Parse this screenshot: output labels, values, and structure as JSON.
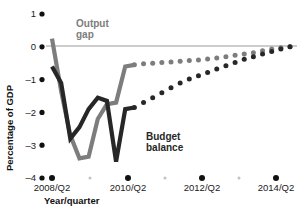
{
  "chart_data": {
    "type": "line",
    "title": "",
    "subtitle": "",
    "xlabel": "Year/quarter",
    "ylabel": "Percentage of GDP",
    "ylim": [
      -4,
      1
    ],
    "yticks": [
      1,
      0,
      -1,
      -2,
      -3,
      -4
    ],
    "ytick_labels": [
      "1",
      "0",
      "–1",
      "–2",
      "–3",
      "–4"
    ],
    "xlim": [
      "2008/Q2",
      "2014/Q4"
    ],
    "xticks": [
      "2008/Q2",
      "2010/Q2",
      "2012/Q2",
      "2014/Q2"
    ],
    "xtick_minor": [
      "2009/Q2",
      "2011/Q2",
      "2013/Q2"
    ],
    "grid": false,
    "zero_line": true,
    "legend_position": "inline-annotations",
    "annotations": [
      {
        "text": "Output gap",
        "color": "#7d7d7d",
        "series": "output_gap"
      },
      {
        "text": "Budget balance",
        "color": "#272727",
        "series": "budget_balance"
      }
    ],
    "x": [
      "2008/Q2",
      "2008/Q3",
      "2008/Q4",
      "2009/Q1",
      "2009/Q2",
      "2009/Q3",
      "2009/Q4",
      "2010/Q1",
      "2010/Q2",
      "2010/Q3",
      "2010/Q4",
      "2011/Q1",
      "2011/Q2",
      "2011/Q3",
      "2011/Q4",
      "2012/Q1",
      "2012/Q2",
      "2012/Q3",
      "2012/Q4",
      "2013/Q1",
      "2013/Q2",
      "2013/Q3",
      "2013/Q4",
      "2014/Q1",
      "2014/Q2",
      "2014/Q3",
      "2014/Q4"
    ],
    "series": [
      {
        "name": "Output gap",
        "color": "#7d7d7d",
        "style_actual": "solid",
        "style_forecast": "dotted",
        "forecast_starts_at": "2010/Q3",
        "values": [
          0.25,
          -1.35,
          -2.7,
          -3.4,
          -3.35,
          -2.2,
          -1.75,
          -1.7,
          -0.6,
          -0.55,
          -0.52,
          -0.5,
          -0.48,
          -0.46,
          -0.44,
          -0.42,
          -0.4,
          -0.37,
          -0.34,
          -0.3,
          -0.26,
          -0.22,
          -0.18,
          -0.12,
          -0.07,
          -0.03,
          0.0
        ]
      },
      {
        "name": "Budget balance",
        "color": "#272727",
        "style_actual": "solid",
        "style_forecast": "dotted",
        "forecast_starts_at": "2010/Q3",
        "values": [
          -0.6,
          -1.1,
          -2.8,
          -2.45,
          -1.9,
          -1.55,
          -1.65,
          -3.5,
          -1.9,
          -1.85,
          -1.7,
          -1.55,
          -1.4,
          -1.25,
          -1.1,
          -0.98,
          -0.88,
          -0.78,
          -0.68,
          -0.58,
          -0.48,
          -0.38,
          -0.3,
          -0.22,
          -0.14,
          -0.07,
          0.0
        ]
      }
    ]
  },
  "axes": {
    "y_title": "Percentage of GDP",
    "x_title": "Year/quarter"
  }
}
